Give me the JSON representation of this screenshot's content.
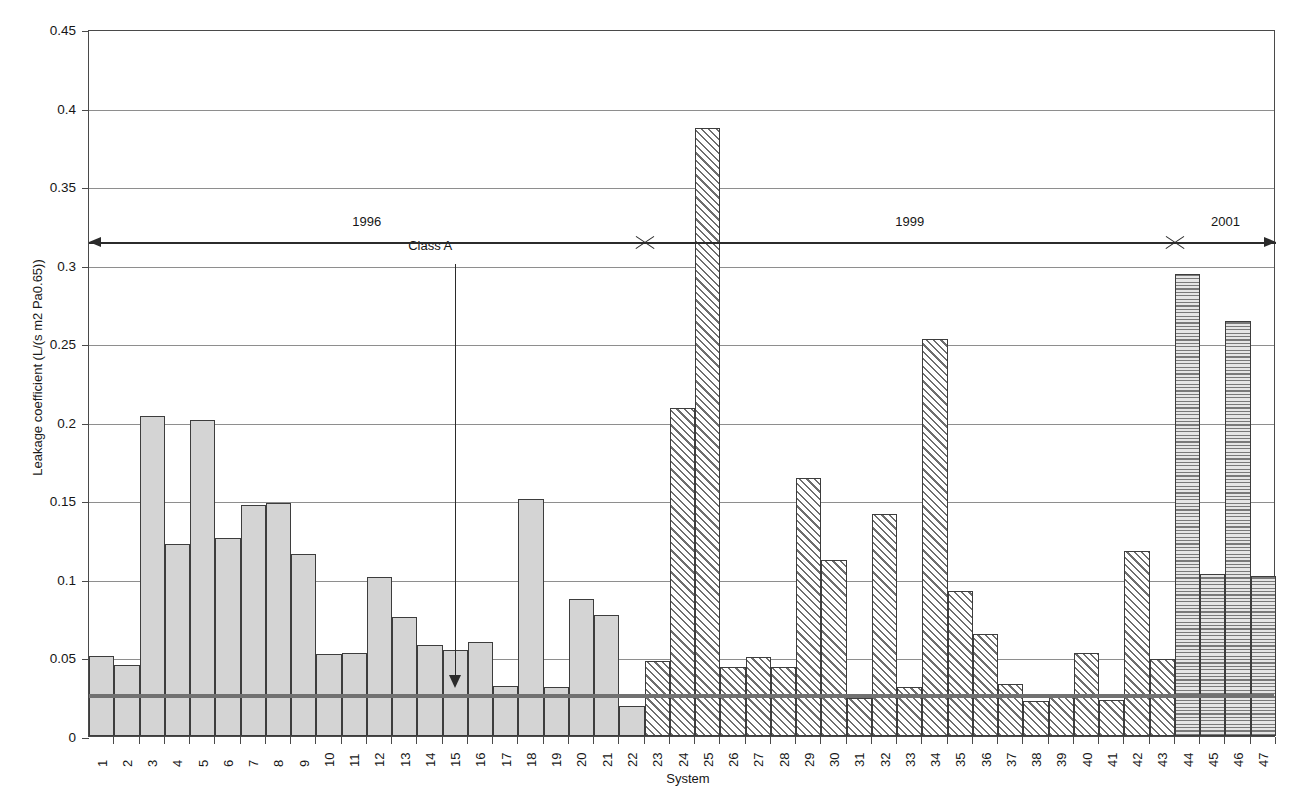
{
  "chart_data": {
    "type": "bar",
    "title": "",
    "xlabel": "System",
    "ylabel": "Leakage coefficient (L/(s m2 Pa0.65))",
    "ylim": [
      0,
      0.45
    ],
    "ytick_labels": [
      "0",
      "0.05",
      "0.1",
      "0.15",
      "0.2",
      "0.25",
      "0.3",
      "0.35",
      "0.4",
      "0.45"
    ],
    "ytick_values": [
      0,
      0.05,
      0.1,
      0.15,
      0.2,
      0.25,
      0.3,
      0.35,
      0.4,
      0.45
    ],
    "grid": true,
    "legend_position": "none",
    "categories": [
      "1",
      "2",
      "3",
      "4",
      "5",
      "6",
      "7",
      "8",
      "9",
      "10",
      "11",
      "12",
      "13",
      "14",
      "15",
      "16",
      "17",
      "18",
      "19",
      "20",
      "21",
      "22",
      "23",
      "24",
      "25",
      "26",
      "27",
      "28",
      "29",
      "30",
      "31",
      "32",
      "33",
      "34",
      "35",
      "36",
      "37",
      "38",
      "39",
      "40",
      "41",
      "42",
      "43",
      "44",
      "45",
      "46",
      "47"
    ],
    "values": [
      0.051,
      0.045,
      0.204,
      0.122,
      0.201,
      0.126,
      0.147,
      0.148,
      0.116,
      0.052,
      0.053,
      0.101,
      0.076,
      0.058,
      0.055,
      0.06,
      0.032,
      0.151,
      0.031,
      0.087,
      0.077,
      0.019,
      0.048,
      0.209,
      0.387,
      0.044,
      0.05,
      0.044,
      0.164,
      0.112,
      0.024,
      0.141,
      0.031,
      0.253,
      0.092,
      0.065,
      0.033,
      0.022,
      0.025,
      0.053,
      0.023,
      0.118,
      0.049,
      0.294,
      0.103,
      0.264,
      0.102
    ],
    "series_groups": [
      {
        "name": "1996",
        "from_index": 1,
        "to_index": 22,
        "fill": "solid-grey"
      },
      {
        "name": "1999",
        "from_index": 23,
        "to_index": 43,
        "fill": "diagonal-hatch"
      },
      {
        "name": "2001",
        "from_index": 44,
        "to_index": 47,
        "fill": "horizontal-hatch"
      }
    ],
    "reference_line": {
      "label": "Class A",
      "value": 0.027,
      "color": "#717171"
    },
    "annotations": [
      {
        "text": "Class A",
        "type": "arrow-callout",
        "points_to": 0.027
      },
      {
        "text": "1996",
        "type": "span-label"
      },
      {
        "text": "1999",
        "type": "span-label"
      },
      {
        "text": "2001",
        "type": "span-label"
      }
    ]
  },
  "axes": {
    "y_title": "Leakage coefficient (L/(s m2 Pa0.65))",
    "x_title": "System"
  },
  "colors": {
    "frame": "#4a4a4a",
    "grid": "#8e8e8e",
    "bar_outline": "#3d3d3d",
    "bar_solid": "#d4d4d4",
    "reference": "#717171",
    "text": "#161616"
  }
}
